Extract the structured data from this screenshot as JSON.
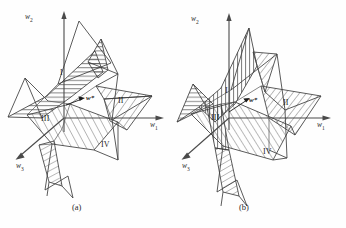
{
  "figure": {
    "panels": [
      {
        "id": "a",
        "caption": "(a)",
        "axes": [
          {
            "name": "w2",
            "label": "w",
            "sub": "2"
          },
          {
            "name": "w1",
            "label": "w",
            "sub": "1"
          },
          {
            "name": "w3",
            "label": "w",
            "sub": "3"
          }
        ],
        "vector_label": "w*",
        "regions": [
          "I",
          "II",
          "III",
          "IV"
        ]
      },
      {
        "id": "b",
        "caption": "(b)",
        "axes": [
          {
            "name": "w2",
            "label": "w",
            "sub": "2"
          },
          {
            "name": "w1",
            "label": "w",
            "sub": "1"
          },
          {
            "name": "w3",
            "label": "w",
            "sub": "3"
          }
        ],
        "vector_label": "w*",
        "regions": [
          "I",
          "II",
          "III",
          "IV"
        ]
      }
    ],
    "colors": {
      "background": "#fefefe",
      "stroke": "#3d3d3d",
      "axis": "#4a4a4a",
      "hatch": "#4a4a4a",
      "text": "#1f1f1f"
    },
    "icons": {
      "arrowhead": "arrowhead-icon",
      "vector_arrow": "vector-arrow-icon"
    }
  }
}
